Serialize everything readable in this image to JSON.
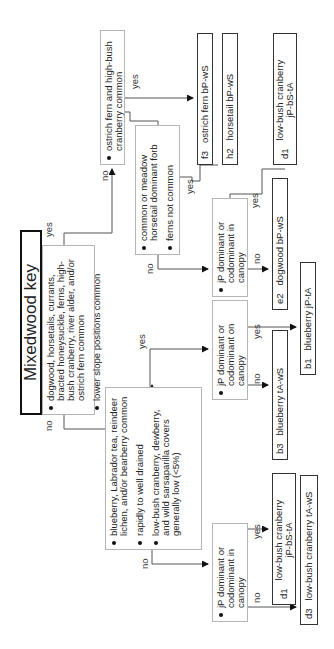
{
  "title": "Mixedwood key",
  "root": {
    "criteria": [
      "dogwood, horsetails, currants, bracted honeysuckle, ferns, high-bush cranberry, river alder, and/or ostrich fern common",
      "lower slope positions common"
    ]
  },
  "nodes": {
    "ostrich_q": [
      "ostrich fern and high-bush cranberry common"
    ],
    "forb_q": [
      "common or meadow horsetail dominant forb",
      "ferns not common"
    ],
    "blueberry_q": [
      "blueberry, Labrador tea, reindeer lichen, and/or bearberry common",
      "rapidly to well drained",
      "low-bush cranberry, dewberry, and wild sarsaparilla covers generally low (<5%)"
    ],
    "jp_top": [
      "jP dominant or codominant in canopy"
    ],
    "jp_mid": [
      "jP dominant or codominant on canopy"
    ],
    "jp_bottom": [
      "jP dominant or codominant in canopy"
    ]
  },
  "results": {
    "f3": {
      "code": "f3",
      "label": "ostrich fern bP-wS"
    },
    "h2": {
      "code": "h2",
      "label": "horsetail bP-wS"
    },
    "d1_top": {
      "code": "d1",
      "label": "low-bush cranberry",
      "label2": "jP-bS-tA"
    },
    "e2": {
      "code": "e2",
      "label": "dogwood bP-wS"
    },
    "b1": {
      "code": "b1",
      "label": "blueberry jP-tA"
    },
    "b3": {
      "code": "b3",
      "label": "blueberry tA-wS"
    },
    "d1_bottom": {
      "code": "d1",
      "label": "low-bush cranberry",
      "label2": "jP-bS-tA"
    },
    "d3": {
      "code": "d3",
      "label": "low-bush cranberry tA-wS"
    }
  },
  "edge_labels": {
    "yes": "yes",
    "no": "no"
  }
}
